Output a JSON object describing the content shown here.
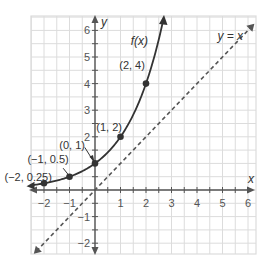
{
  "chart_data": {
    "type": "line",
    "title": "",
    "xlabel": "x",
    "ylabel": "y",
    "xlim": [
      -2.5,
      6.3
    ],
    "ylim": [
      -2.4,
      6.4
    ],
    "grid": true,
    "grid_step": 0.5,
    "x_ticks": [
      -2,
      -1,
      1,
      2,
      3,
      4,
      5,
      6
    ],
    "x_tick_labels": [
      "−2",
      "−1",
      "1",
      "2",
      "3",
      "4",
      "5",
      "6"
    ],
    "y_ticks": [
      -2,
      -1,
      2,
      3,
      4,
      5,
      6
    ],
    "y_tick_labels": [
      "−2",
      "−1",
      "2",
      "3",
      "4",
      "5",
      "6"
    ],
    "series": [
      {
        "name": "f(x)",
        "label": "f(x)",
        "style": "solid",
        "formula": "2^x",
        "points": [
          {
            "x": -2,
            "y": 0.25,
            "label": "(−2, 0.25)"
          },
          {
            "x": -1,
            "y": 0.5,
            "label": "(−1, 0.5)"
          },
          {
            "x": 0,
            "y": 1,
            "label": "(0, 1)"
          },
          {
            "x": 1,
            "y": 2,
            "label": "(1, 2)"
          },
          {
            "x": 2,
            "y": 4,
            "label": "(2, 4)"
          }
        ]
      },
      {
        "name": "y = x",
        "label": "y = x",
        "style": "dashed",
        "formula": "x"
      }
    ]
  },
  "colors": {
    "grid": "#dcdcdc",
    "axis": "#555555",
    "curve": "#333333",
    "dashed": "#555555"
  }
}
